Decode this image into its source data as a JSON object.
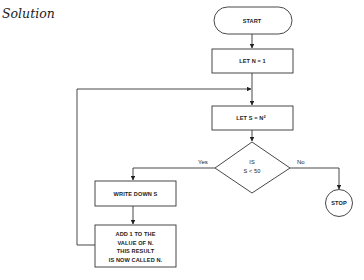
{
  "heading": "Solution",
  "flowchart": {
    "nodes": {
      "start": "START",
      "let_n": "LET N = 1",
      "let_s": "LET S = N",
      "let_s_sup": "2",
      "decision_line1": "IS",
      "decision_line2": "S < 50",
      "stop": "STOP",
      "write": "WRITE DOWN S",
      "add_line1": "ADD 1 TO THE",
      "add_line2": "VALUE OF N.",
      "add_line3": "THIS RESULT",
      "add_line4": "IS NOW CALLED N."
    },
    "branches": {
      "yes": "Yes",
      "no": "No"
    }
  }
}
